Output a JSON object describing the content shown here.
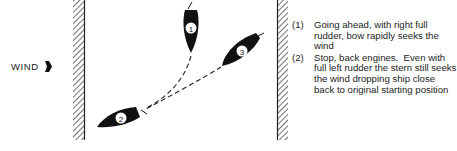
{
  "wind": {
    "label": "WIND",
    "arrow_icon": "wind-arrow-icon"
  },
  "boats": [
    {
      "id": "1",
      "label": "1"
    },
    {
      "id": "2",
      "label": "2"
    },
    {
      "id": "3",
      "label": "3"
    }
  ],
  "notes": [
    {
      "number": "(1)",
      "text": "Going ahead, with right full rudder, bow rapidly seeks the wind"
    },
    {
      "number": "(2)",
      "text": "Stop, back engines.  Even with full left rudder the stern still seeks the wind dropping ship close back to original starting position"
    }
  ],
  "colors": {
    "ink": "#111111",
    "background": "#ffffff"
  }
}
